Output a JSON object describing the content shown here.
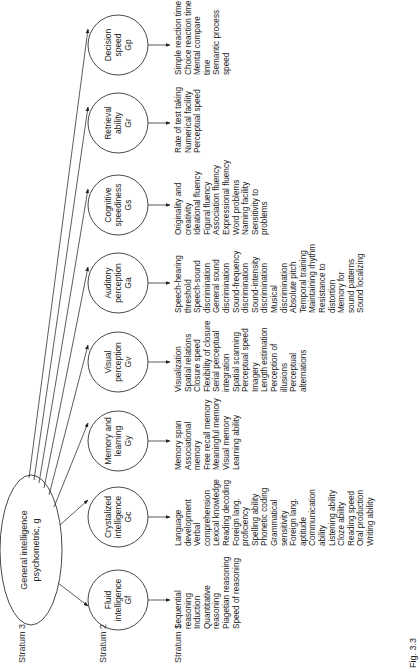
{
  "strata": {
    "stratum3": "Stratum 3",
    "stratum2": "Stratum 2",
    "stratum1": "Stratum 1"
  },
  "general": {
    "line1": "General intelligence",
    "line2": "psychometric, g"
  },
  "broad_abilities": [
    {
      "name": "Fluid intelligence",
      "label_lines": [
        "Fluid",
        "intelligence",
        "Gf"
      ],
      "narrow": [
        "Sequential",
        "reasoning",
        "Induction",
        "Quantitative",
        "reasoning",
        "Piagetian reasoning",
        "Speed of reasoning"
      ]
    },
    {
      "name": "Crystalized intelligence",
      "label_lines": [
        "Crystalized",
        "intelligence",
        "Gc"
      ],
      "narrow": [
        "Language",
        "development",
        "Verbal",
        "comprehension",
        "Lexical knowledge",
        "Reading decoding",
        "Foreign lang.",
        "proficiency",
        "Spelling ability",
        "Phonetic coding",
        "Grammatical",
        "sensitivity",
        "Foreign lang.",
        "aptitude",
        "Communication",
        "ability",
        "Listening ability",
        "Cloze ability",
        "Reading speed",
        "Oral production",
        "Writing ability"
      ]
    },
    {
      "name": "Memory and learning",
      "label_lines": [
        "Memory and",
        "learning",
        "Gy"
      ],
      "narrow": [
        "Memory span",
        "Associational",
        "memory",
        "Free recall memory",
        "Meaningful memory",
        "Visual memory",
        "Learning ability"
      ]
    },
    {
      "name": "Visual perception",
      "label_lines": [
        "Visual",
        "perception",
        "Gv"
      ],
      "narrow": [
        "Visualization",
        "Spatial relations",
        "Closure speed",
        "Flexibility of closure",
        "Serial perceptual",
        "integration",
        "Spatial scanning",
        "Perceptual speed",
        "Imagery",
        "Length estimation",
        "Perception of",
        "illusions",
        "Perceptual",
        "alternations"
      ]
    },
    {
      "name": "Auditory perception",
      "label_lines": [
        "Auditory",
        "perception",
        "Ga"
      ],
      "narrow": [
        "Speech-hearing",
        "threshold",
        "Speech-sound",
        "discrimination",
        "General sound",
        "discrimination",
        "Sound-frequency",
        "discrimination",
        "Sound-intensity",
        "discrimination",
        "Musical",
        "discrimination",
        "Absolute pitch",
        "Temporal training",
        "Maintaining rhythm",
        "Resistance to",
        "distortion",
        "Memory for",
        "sound patterns",
        "Sound localizing"
      ]
    },
    {
      "name": "Cognitive speediness",
      "label_lines": [
        "Cognitive",
        "speediness",
        "Gs"
      ],
      "narrow": [
        "Originality and",
        "creativity",
        "Ideational fluency",
        "Figural fluency",
        "Association fluency",
        "Expressional fluency",
        "Word problems",
        "Naming facility",
        "Sensitivity to",
        "problems"
      ]
    },
    {
      "name": "Retrieval ability",
      "label_lines": [
        "Retrieval",
        "ability",
        "Gr"
      ],
      "narrow": [
        "Rate of test taking",
        "Numerical facility",
        "Perceptual speed"
      ]
    },
    {
      "name": "Decision speed",
      "label_lines": [
        "Decision",
        "speed",
        "Gp"
      ],
      "narrow": [
        "Simple reaction time",
        "Choice reaction time",
        "Mental compare",
        "time",
        "Semantic process",
        "speed"
      ]
    }
  ],
  "caption": "Fig. 3.3"
}
